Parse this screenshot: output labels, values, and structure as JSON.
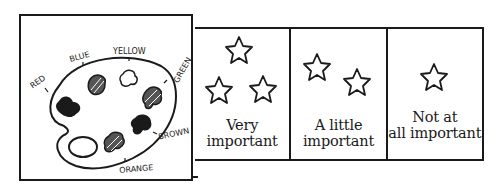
{
  "palette": {
    "title": "paint palette",
    "colors": [
      {
        "name": "RED",
        "fill": "solid"
      },
      {
        "name": "BLUE",
        "fill": "hatched"
      },
      {
        "name": "YELLOW",
        "fill": "empty"
      },
      {
        "name": "GREEN",
        "fill": "hatched"
      },
      {
        "name": "BROWN",
        "fill": "solid"
      },
      {
        "name": "ORANGE",
        "fill": "hatched"
      }
    ],
    "labels": {
      "red": "RED",
      "blue": "BLUE",
      "yellow": "YELLOW",
      "green": "GREEN",
      "brown": "BROWN",
      "orange": "ORANGE"
    }
  },
  "scale": {
    "options": [
      {
        "line1": "Very",
        "line2": "important",
        "stars": 3
      },
      {
        "line1": "A little",
        "line2": "important",
        "stars": 2
      },
      {
        "line1": "Not at",
        "line2": "all important",
        "stars": 1
      }
    ]
  },
  "colors": {
    "ink": "#1a1a1a",
    "background": "#ffffff"
  }
}
